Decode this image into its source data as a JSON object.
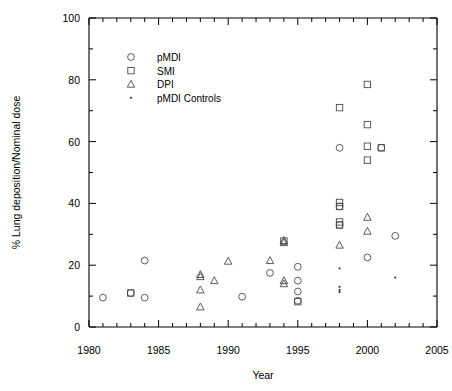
{
  "chart_data": {
    "type": "scatter",
    "title": "",
    "xlabel": "Year",
    "ylabel": "% Lung deposition/Nominal dose",
    "xlim": [
      1980,
      2005
    ],
    "ylim": [
      0,
      100
    ],
    "x_ticks": [
      1980,
      1985,
      1990,
      1995,
      2000,
      2005
    ],
    "x_tick_labels": [
      "1980",
      "1985",
      "1990",
      "1995",
      "2000",
      "2005"
    ],
    "x_minor_step": 1,
    "y_ticks": [
      0,
      20,
      40,
      60,
      80,
      100
    ],
    "y_tick_labels": [
      "0",
      "20",
      "40",
      "60",
      "80",
      "100"
    ],
    "y_minor_step": 10,
    "grid": false,
    "legend_position": "upper-left-inside",
    "legend_entries": [
      {
        "label": "pMDI",
        "marker": "circle"
      },
      {
        "label": "SMI",
        "marker": "square"
      },
      {
        "label": "DPI",
        "marker": "triangle"
      },
      {
        "label": "pMDI Controls",
        "marker": "dot"
      }
    ],
    "series": [
      {
        "name": "pMDI",
        "marker": "circle",
        "points": [
          [
            1981,
            9.5
          ],
          [
            1983,
            11.0
          ],
          [
            1984,
            21.5
          ],
          [
            1984,
            9.5
          ],
          [
            1991,
            9.8
          ],
          [
            1993,
            17.5
          ],
          [
            1995,
            19.5
          ],
          [
            1995,
            15.0
          ],
          [
            1995,
            11.5
          ],
          [
            1995,
            8.5
          ],
          [
            1998,
            58.0
          ],
          [
            1998,
            39.0
          ],
          [
            1998,
            33.0
          ],
          [
            2000,
            22.5
          ],
          [
            2001,
            58.0
          ],
          [
            2002,
            29.5
          ]
        ]
      },
      {
        "name": "SMI",
        "marker": "square",
        "points": [
          [
            1983,
            11.0
          ],
          [
            1994,
            27.8
          ],
          [
            1995,
            8.2
          ],
          [
            1998,
            71.0
          ],
          [
            1998,
            40.3
          ],
          [
            1998,
            39.0
          ],
          [
            1998,
            34.0
          ],
          [
            1998,
            33.0
          ],
          [
            2000,
            78.5
          ],
          [
            2000,
            65.5
          ],
          [
            2000,
            58.5
          ],
          [
            2000,
            54.0
          ],
          [
            2001,
            58.0
          ]
        ]
      },
      {
        "name": "DPI",
        "marker": "triangle",
        "points": [
          [
            1988,
            17.0
          ],
          [
            1988,
            16.3
          ],
          [
            1988,
            12.0
          ],
          [
            1988,
            6.5
          ],
          [
            1989,
            15.0
          ],
          [
            1990,
            21.3
          ],
          [
            1993,
            21.5
          ],
          [
            1994,
            28.0
          ],
          [
            1994,
            27.3
          ],
          [
            1994,
            15.0
          ],
          [
            1994,
            14.0
          ],
          [
            1998,
            26.5
          ],
          [
            2000,
            35.5
          ],
          [
            2000,
            31.0
          ]
        ]
      },
      {
        "name": "pMDI Controls",
        "marker": "dot",
        "points": [
          [
            1998,
            19.0
          ],
          [
            1998,
            13.0
          ],
          [
            1998,
            12.0
          ],
          [
            1998,
            11.3
          ],
          [
            2002,
            16.0
          ]
        ]
      }
    ]
  }
}
